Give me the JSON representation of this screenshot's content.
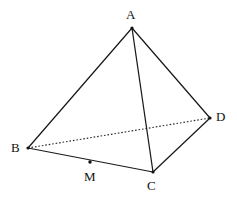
{
  "figure": {
    "kind": "geometry-diagram",
    "shape_name": "tetrahedron",
    "width": 237,
    "height": 197,
    "background_color": "#ffffff",
    "stroke_color": "#1a1a1a",
    "hidden_edge_color": "#2b2b2b",
    "label_color": "#111111",
    "vertices": [
      {
        "id": "A",
        "label": "A",
        "x": 132,
        "y": 28,
        "label_x": 126,
        "label_y": 8
      },
      {
        "id": "B",
        "label": "B",
        "x": 28,
        "y": 148,
        "label_x": 11,
        "label_y": 141
      },
      {
        "id": "C",
        "label": "C",
        "x": 153,
        "y": 172,
        "label_x": 147,
        "label_y": 179
      },
      {
        "id": "D",
        "label": "D",
        "x": 210,
        "y": 118,
        "label_x": 216,
        "label_y": 110
      }
    ],
    "points": [
      {
        "id": "M",
        "label": "M",
        "x": 90,
        "y": 162,
        "label_x": 84,
        "label_y": 170,
        "on_segment": "BC"
      }
    ],
    "edges": [
      {
        "id": "AB",
        "from": "A",
        "to": "B",
        "style": "solid",
        "visible": true
      },
      {
        "id": "AC",
        "from": "A",
        "to": "C",
        "style": "solid",
        "visible": true
      },
      {
        "id": "AD",
        "from": "A",
        "to": "D",
        "style": "solid",
        "visible": true
      },
      {
        "id": "BC",
        "from": "B",
        "to": "C",
        "style": "solid",
        "visible": true
      },
      {
        "id": "CD",
        "from": "C",
        "to": "D",
        "style": "solid",
        "visible": true
      },
      {
        "id": "BD",
        "from": "B",
        "to": "D",
        "style": "dotted",
        "visible": false
      }
    ]
  }
}
